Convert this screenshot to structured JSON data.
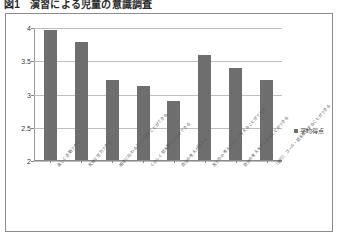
{
  "figure": {
    "caption_number": "図1",
    "caption_text": "演習による児童の意識調査",
    "caption_full": "図1　演習による児童の意識調査"
  },
  "legend": {
    "position": "right",
    "swatch_color": "#6e6e6e",
    "entries": [
      {
        "label": "平均得点",
        "marker": "square-marker",
        "color": "#6e6e6e"
      }
    ]
  },
  "axes": {
    "y_ticks": [
      "4",
      "3.5",
      "3",
      "2.5",
      "2"
    ],
    "y_tick_values": [
      4,
      3.5,
      3,
      2.5,
      2
    ],
    "y_min": 2,
    "y_max": 4,
    "grid": true,
    "xlabel": "",
    "ylabel": ""
  },
  "chart_data": {
    "type": "bar",
    "title": "演習による児童の意識調査",
    "xlabel": "",
    "ylabel": "",
    "ylim": [
      2,
      4
    ],
    "grid": true,
    "legend_position": "right",
    "bar_color": "#6e6e6e",
    "categories": [
      "楽しく活動できる",
      "友達と協力できる",
      "相手に伝わるように話すことができる",
      "くわしく話を聞くことができる",
      "自分の考えが深まる",
      "友だちの考えと比べて考えることができる",
      "自分の考えをまとめることができる",
      "（進行）ゴール・話を整理することができる"
    ],
    "values": [
      3.95,
      3.78,
      3.21,
      3.11,
      2.89,
      3.58,
      3.39,
      3.2
    ],
    "series": [
      {
        "name": "平均得点",
        "values": [
          3.95,
          3.78,
          3.21,
          3.11,
          2.89,
          3.58,
          3.39,
          3.2
        ]
      }
    ]
  }
}
